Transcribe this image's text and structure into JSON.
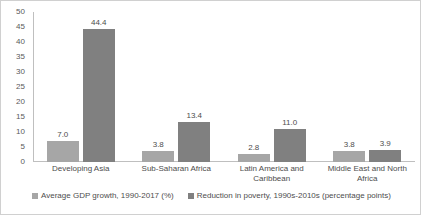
{
  "chart_data": {
    "type": "bar",
    "title": "",
    "subtitle": "",
    "xlabel": "",
    "ylabel": "",
    "ylim": [
      0,
      50
    ],
    "ytick_step": 5,
    "yticks": [
      "50",
      "45",
      "40",
      "35",
      "30",
      "25",
      "20",
      "15",
      "10",
      "5",
      "0"
    ],
    "grid": false,
    "legend_position": "bottom",
    "categories": [
      "Developing Asia",
      "Sub-Saharan Africa",
      "Latin America and Caribbean",
      "Middle East and North Africa"
    ],
    "series": [
      {
        "name": "Average GDP growth, 1990-2017 (%)",
        "color": "#a6a6a6",
        "values": [
          7.0,
          3.8,
          2.8,
          3.8
        ],
        "labels": [
          "7.0",
          "3.8",
          "2.8",
          "3.8"
        ]
      },
      {
        "name": "Reduction in poverty, 1990s-2010s (percentage points)",
        "color": "#808080",
        "values": [
          44.4,
          13.4,
          11.0,
          3.9
        ],
        "labels": [
          "44.4",
          "13.4",
          "11.0",
          "3.9"
        ]
      }
    ]
  },
  "legend": {
    "items": [
      {
        "label": "Average GDP growth, 1990-2017 (%)",
        "color": "#a6a6a6"
      },
      {
        "label": "Reduction in poverty, 1990s-2010s (percentage points)",
        "color": "#808080"
      }
    ]
  },
  "axis": {
    "line_color": "#bfbfbf"
  }
}
